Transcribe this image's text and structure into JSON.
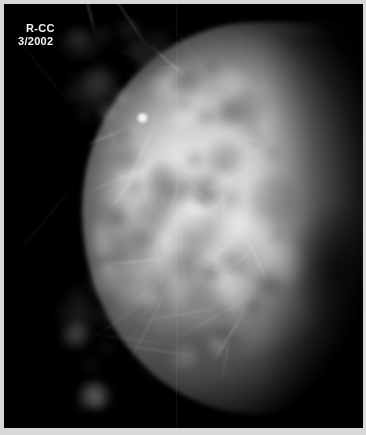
{
  "image": {
    "modality": "mammogram",
    "background_color": "#000000",
    "film_border_color": "#d8d8d6",
    "annotation_text_color": "#f4f4f4",
    "width": 366,
    "height": 435
  },
  "annotation": {
    "view_label": "R-CC",
    "date_label": "3/2002"
  },
  "findings": {
    "focal_nodule_present": true
  }
}
